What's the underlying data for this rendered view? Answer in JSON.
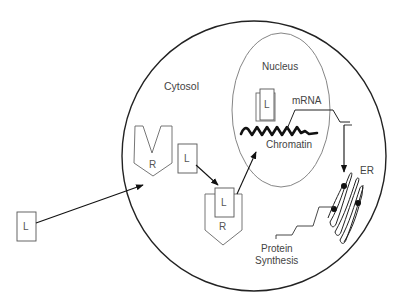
{
  "diagram": {
    "labels": {
      "cytosol": "Cytosol",
      "nucleus": "Nucleus",
      "mrna": "mRNA",
      "chromatin": "Chromatin",
      "er": "ER",
      "protein_line1": "Protein",
      "protein_line2": "Synthesis"
    },
    "ligand_label": "L",
    "receptor_label": "R",
    "colors": {
      "stroke": "#222222",
      "thin_stroke": "#666666",
      "text": "#444444",
      "background": "#ffffff"
    },
    "nodes": [
      {
        "id": "ligand-extracellular",
        "label": "L"
      },
      {
        "id": "receptor-empty",
        "label": "R"
      },
      {
        "id": "ligand-cytosol",
        "label": "L"
      },
      {
        "id": "ligand-receptor-complex",
        "labels": [
          "L",
          "R"
        ]
      },
      {
        "id": "nucleus-ligand-complex",
        "label": "L"
      },
      {
        "id": "chromatin",
        "label": "Chromatin"
      },
      {
        "id": "mrna",
        "label": "mRNA"
      },
      {
        "id": "er",
        "label": "ER"
      },
      {
        "id": "protein-synthesis",
        "label": "Protein Synthesis"
      }
    ],
    "edges": [
      {
        "from": "ligand-extracellular",
        "to": "receptor-empty"
      },
      {
        "from": "ligand-cytosol",
        "to": "ligand-receptor-complex"
      },
      {
        "from": "ligand-receptor-complex",
        "to": "nucleus-ligand-complex"
      },
      {
        "from": "mrna",
        "to": "er"
      }
    ]
  }
}
